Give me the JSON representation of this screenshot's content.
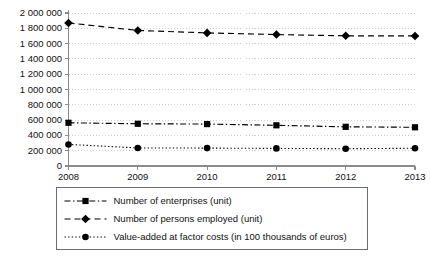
{
  "chart_data": {
    "type": "line",
    "title": "",
    "subtitle": "",
    "xlabel": "",
    "ylabel": "",
    "categories": [
      "2008",
      "2009",
      "2010",
      "2011",
      "2012",
      "2013"
    ],
    "x_tick_labels": [
      "2008",
      "2009",
      "2010",
      "2011",
      "2012",
      "2013"
    ],
    "y_tick_labels": [
      "0",
      "200 000",
      "400 000",
      "600 000",
      "800 000",
      "1 000 000",
      "1 200 000",
      "1 400 000",
      "1 600 000",
      "1 800 000",
      "2 000 000"
    ],
    "y_tick_values": [
      0,
      200000,
      400000,
      600000,
      800000,
      1000000,
      1200000,
      1400000,
      1600000,
      1800000,
      2000000
    ],
    "ylim": [
      0,
      2000000
    ],
    "grid": true,
    "grid_axis": "y",
    "legend_position": "bottom",
    "series": [
      {
        "name": "Number of enterprises (unit)",
        "marker": "square",
        "linestyle": "dash-dot",
        "color": "#000000",
        "values": [
          565000,
          552000,
          548000,
          532000,
          512000,
          506000
        ]
      },
      {
        "name": "Number of persons employed (unit)",
        "marker": "diamond",
        "linestyle": "dashed",
        "color": "#000000",
        "values": [
          1870000,
          1772000,
          1740000,
          1718000,
          1702000,
          1700000
        ]
      },
      {
        "name": "Value-added at factor costs (in 100 thousands of euros)",
        "marker": "circle",
        "linestyle": "dotted",
        "color": "#000000",
        "values": [
          282000,
          236000,
          234000,
          230000,
          226000,
          232000
        ]
      }
    ]
  },
  "legend": {
    "entries": [
      {
        "label": "Number of enterprises (unit)",
        "marker": "square-marker-icon",
        "linestyle": "dash-dot"
      },
      {
        "label": "Number of persons employed (unit)",
        "marker": "diamond-marker-icon",
        "linestyle": "dashed"
      },
      {
        "label": "Value-added at factor costs (in 100 thousands of euros)",
        "marker": "circle-marker-icon",
        "linestyle": "dotted"
      }
    ]
  },
  "colors": {
    "series": "#000000",
    "grid": "#c9c9c9",
    "axis": "#8a8a8a",
    "background": "#ffffff",
    "legend_border": "#6d6d6d"
  }
}
